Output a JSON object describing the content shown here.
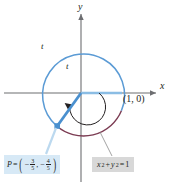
{
  "figure": {
    "type": "unit-circle-diagram",
    "axes": {
      "x_label": "x",
      "y_label": "y"
    },
    "arc_labels": {
      "outer": "t",
      "inner": "t"
    },
    "point_on_axis": "(1, 0)",
    "callouts": {
      "point": {
        "name": "P",
        "equals": "=",
        "x_sign": "−",
        "x_num": "3",
        "x_den": "5",
        "separator": ",",
        "y_sign": "−",
        "y_num": "4",
        "y_den": "5",
        "open": "(",
        "close": ")",
        "background": "#d7e9f6"
      },
      "equation": {
        "x_var": "x",
        "x_exp": "2",
        "plus": "+",
        "y_var": "y",
        "y_exp": "2",
        "equals": "=",
        "value": "1",
        "background": "#d8d8d8"
      }
    },
    "colors": {
      "circle_blue": "#5b9bd5",
      "arc_maroon": "#7b3b52",
      "radius_blue": "#4a90cf",
      "axis_gray": "#6d6e71",
      "inner_arc": "#231f20",
      "leader_blue": "#bcd9ef"
    },
    "geometry": {
      "center_x": 81,
      "center_y": 93,
      "radius": 41,
      "inner_arc_radius": 18,
      "point_p_x": 57,
      "point_p_y": 126
    }
  }
}
